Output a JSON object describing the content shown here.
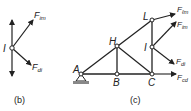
{
  "figure_b": {
    "caption": "(b)",
    "node_label": "I",
    "forces": [
      {
        "name": "F",
        "sub": "im"
      },
      {
        "name": "F",
        "sub": "di"
      }
    ]
  },
  "figure_c": {
    "caption": "(c)",
    "nodes": [
      "A",
      "B",
      "C",
      "H",
      "I",
      "L"
    ],
    "forces": [
      {
        "name": "F",
        "sub": "ℓm"
      },
      {
        "name": "F",
        "sub": "im"
      },
      {
        "name": "F",
        "sub": "di"
      },
      {
        "name": "F",
        "sub": "cd"
      }
    ]
  },
  "colors": {
    "line": "#222222",
    "background": "#ffffff"
  }
}
